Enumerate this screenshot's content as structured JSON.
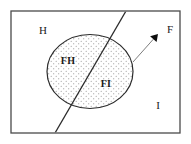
{
  "figure": {
    "canvas": {
      "width": 191,
      "height": 144,
      "background": "#ffffff"
    },
    "universe_rect": {
      "name": "I",
      "x": 11,
      "y": 11,
      "width": 169,
      "height": 122,
      "stroke": "#4a4a4a",
      "stroke_width": 1.3,
      "fill": "#ffffff"
    },
    "ellipse": {
      "name": "F",
      "cx": 90,
      "cy": 71.5,
      "rx": 43,
      "ry": 37,
      "stroke": "#2b2b2b",
      "stroke_width": 1.2,
      "fill_pattern": "dotted-stipple",
      "dot_color": "#8d8d8d",
      "dot_spacing": 5,
      "dot_radius": 0.55
    },
    "divider_line": {
      "name": "H-I boundary",
      "x1": 126,
      "y1": 11,
      "x2": 55,
      "y2": 133,
      "stroke": "#2b2b2b",
      "stroke_width": 1.3
    },
    "leader_arrow": {
      "from_x": 133,
      "from_y": 62,
      "to_x": 158,
      "to_y": 34,
      "stroke": "#6e6e6e",
      "stroke_width": 0.9,
      "head_fill": "#0d0d0d",
      "head_size": 7
    },
    "labels": [
      {
        "id": "label-h",
        "text": "H",
        "x": 43,
        "y": 34,
        "style": "plain",
        "anchor": "middle"
      },
      {
        "id": "label-fh",
        "text": "FH",
        "x": 68,
        "y": 64,
        "style": "bold",
        "anchor": "middle"
      },
      {
        "id": "label-fi",
        "text": "FI",
        "x": 106,
        "y": 87,
        "style": "bold",
        "anchor": "middle"
      },
      {
        "id": "label-i",
        "text": "I",
        "x": 158,
        "y": 109,
        "style": "plain",
        "anchor": "middle"
      },
      {
        "id": "label-f",
        "text": "F",
        "x": 170,
        "y": 33,
        "style": "plain",
        "anchor": "middle"
      }
    ]
  }
}
